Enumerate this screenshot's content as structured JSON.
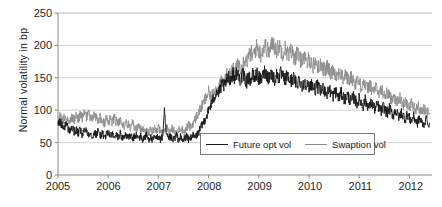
{
  "chart_data": {
    "type": "line",
    "title": "",
    "xlabel": "",
    "ylabel": "Normal volatility in bp",
    "xlim": [
      2005.0,
      2012.45
    ],
    "ylim": [
      0,
      250
    ],
    "grid": true,
    "legend_position": "inside-bottom-center",
    "ytick_labels": [
      "0",
      "50",
      "100",
      "150",
      "200",
      "250"
    ],
    "ytick_values": [
      0,
      50,
      100,
      150,
      200,
      250
    ],
    "xtick_labels": [
      "2005",
      "2006",
      "2007",
      "2008",
      "2009",
      "2010",
      "2011",
      "2012"
    ],
    "xtick_values": [
      2005,
      2006,
      2007,
      2008,
      2009,
      2010,
      2011,
      2012
    ],
    "series": [
      {
        "name": "Future opt vol",
        "color": "#1a1a1a",
        "x": [
          2005.0,
          2005.04,
          2005.08,
          2005.12,
          2005.16,
          2005.2,
          2005.24,
          2005.28,
          2005.32,
          2005.36,
          2005.4,
          2005.44,
          2005.48,
          2005.52,
          2005.56,
          2005.6,
          2005.64,
          2005.68,
          2005.72,
          2005.76,
          2005.8,
          2005.84,
          2005.88,
          2005.92,
          2005.96,
          2006.0,
          2006.04,
          2006.08,
          2006.12,
          2006.16,
          2006.2,
          2006.24,
          2006.28,
          2006.32,
          2006.36,
          2006.4,
          2006.44,
          2006.48,
          2006.52,
          2006.56,
          2006.6,
          2006.64,
          2006.68,
          2006.72,
          2006.76,
          2006.8,
          2006.84,
          2006.88,
          2006.92,
          2006.96,
          2007.0,
          2007.04,
          2007.08,
          2007.12,
          2007.16,
          2007.2,
          2007.24,
          2007.28,
          2007.32,
          2007.36,
          2007.4,
          2007.44,
          2007.48,
          2007.52,
          2007.56,
          2007.6,
          2007.64,
          2007.68,
          2007.72,
          2007.76,
          2007.8,
          2007.84,
          2007.88,
          2007.92,
          2007.96,
          2008.0,
          2008.04,
          2008.08,
          2008.12,
          2008.16,
          2008.2,
          2008.24,
          2008.28,
          2008.32,
          2008.36,
          2008.4,
          2008.44,
          2008.48,
          2008.52,
          2008.56,
          2008.6,
          2008.64,
          2008.68,
          2008.72,
          2008.76,
          2008.8,
          2008.84,
          2008.88,
          2008.92,
          2008.96,
          2009.0,
          2009.04,
          2009.08,
          2009.12,
          2009.16,
          2009.2,
          2009.24,
          2009.28,
          2009.32,
          2009.36,
          2009.4,
          2009.44,
          2009.48,
          2009.52,
          2009.56,
          2009.6,
          2009.64,
          2009.68,
          2009.72,
          2009.76,
          2009.8,
          2009.84,
          2009.88,
          2009.92,
          2009.96,
          2010.0,
          2010.04,
          2010.08,
          2010.12,
          2010.16,
          2010.2,
          2010.24,
          2010.28,
          2010.32,
          2010.36,
          2010.4,
          2010.44,
          2010.48,
          2010.52,
          2010.56,
          2010.6,
          2010.64,
          2010.68,
          2010.72,
          2010.76,
          2010.8,
          2010.84,
          2010.88,
          2010.92,
          2010.96,
          2011.0,
          2011.04,
          2011.08,
          2011.12,
          2011.16,
          2011.2,
          2011.24,
          2011.28,
          2011.32,
          2011.36,
          2011.4,
          2011.44,
          2011.48,
          2011.52,
          2011.56,
          2011.6,
          2011.64,
          2011.68,
          2011.72,
          2011.76,
          2011.8,
          2011.84,
          2011.88,
          2011.92,
          2011.96,
          2012.0,
          2012.04,
          2012.08,
          2012.12,
          2012.16,
          2012.2,
          2012.24,
          2012.28,
          2012.32,
          2012.4
        ],
        "y": [
          78,
          82,
          76,
          73,
          80,
          71,
          68,
          74,
          66,
          70,
          64,
          69,
          62,
          67,
          71,
          63,
          66,
          60,
          65,
          62,
          68,
          61,
          64,
          58,
          62,
          66,
          60,
          63,
          57,
          61,
          59,
          64,
          56,
          60,
          63,
          57,
          61,
          55,
          59,
          62,
          56,
          60,
          54,
          58,
          61,
          55,
          59,
          53,
          58,
          56,
          61,
          54,
          58,
          96,
          60,
          55,
          59,
          53,
          57,
          61,
          55,
          58,
          52,
          56,
          60,
          54,
          58,
          62,
          57,
          61,
          66,
          72,
          78,
          85,
          92,
          99,
          107,
          114,
          122,
          130,
          126,
          134,
          141,
          136,
          145,
          152,
          147,
          156,
          150,
          158,
          152,
          147,
          155,
          149,
          144,
          152,
          146,
          154,
          148,
          156,
          150,
          146,
          153,
          160,
          155,
          150,
          158,
          152,
          147,
          155,
          150,
          157,
          151,
          146,
          153,
          148,
          144,
          150,
          145,
          140,
          148,
          142,
          137,
          145,
          139,
          134,
          142,
          136,
          131,
          138,
          133,
          128,
          135,
          130,
          125,
          132,
          127,
          122,
          130,
          124,
          119,
          127,
          121,
          116,
          124,
          118,
          113,
          121,
          115,
          110,
          118,
          112,
          107,
          115,
          109,
          104,
          112,
          106,
          101,
          109,
          103,
          98,
          106,
          100,
          95,
          103,
          97,
          92,
          100,
          94,
          89,
          97,
          91,
          86,
          94,
          88,
          83,
          91,
          85,
          80,
          88,
          82,
          77,
          85,
          80
        ]
      },
      {
        "name": "Swaption vol",
        "color": "#8c8c8c",
        "x": [
          2005.0,
          2005.04,
          2005.08,
          2005.12,
          2005.16,
          2005.2,
          2005.24,
          2005.28,
          2005.32,
          2005.36,
          2005.4,
          2005.44,
          2005.48,
          2005.52,
          2005.56,
          2005.6,
          2005.64,
          2005.68,
          2005.72,
          2005.76,
          2005.8,
          2005.84,
          2005.88,
          2005.92,
          2005.96,
          2006.0,
          2006.04,
          2006.08,
          2006.12,
          2006.16,
          2006.2,
          2006.24,
          2006.28,
          2006.32,
          2006.36,
          2006.4,
          2006.44,
          2006.48,
          2006.52,
          2006.56,
          2006.6,
          2006.64,
          2006.68,
          2006.72,
          2006.76,
          2006.8,
          2006.84,
          2006.88,
          2006.92,
          2006.96,
          2007.0,
          2007.04,
          2007.08,
          2007.12,
          2007.16,
          2007.2,
          2007.24,
          2007.28,
          2007.32,
          2007.36,
          2007.4,
          2007.44,
          2007.48,
          2007.52,
          2007.56,
          2007.6,
          2007.64,
          2007.68,
          2007.72,
          2007.76,
          2007.8,
          2007.84,
          2007.88,
          2007.92,
          2007.96,
          2008.0,
          2008.04,
          2008.08,
          2008.12,
          2008.16,
          2008.2,
          2008.24,
          2008.28,
          2008.32,
          2008.36,
          2008.4,
          2008.44,
          2008.48,
          2008.52,
          2008.56,
          2008.6,
          2008.64,
          2008.68,
          2008.72,
          2008.76,
          2008.8,
          2008.84,
          2008.88,
          2008.92,
          2008.96,
          2009.0,
          2009.04,
          2009.08,
          2009.12,
          2009.16,
          2009.2,
          2009.24,
          2009.28,
          2009.32,
          2009.36,
          2009.4,
          2009.44,
          2009.48,
          2009.52,
          2009.56,
          2009.6,
          2009.64,
          2009.68,
          2009.72,
          2009.76,
          2009.8,
          2009.84,
          2009.88,
          2009.92,
          2009.96,
          2010.0,
          2010.04,
          2010.08,
          2010.12,
          2010.16,
          2010.2,
          2010.24,
          2010.28,
          2010.32,
          2010.36,
          2010.4,
          2010.44,
          2010.48,
          2010.52,
          2010.56,
          2010.6,
          2010.64,
          2010.68,
          2010.72,
          2010.76,
          2010.8,
          2010.84,
          2010.88,
          2010.92,
          2010.96,
          2011.0,
          2011.04,
          2011.08,
          2011.12,
          2011.16,
          2011.2,
          2011.24,
          2011.28,
          2011.32,
          2011.36,
          2011.4,
          2011.44,
          2011.48,
          2011.52,
          2011.56,
          2011.6,
          2011.64,
          2011.68,
          2011.72,
          2011.76,
          2011.8,
          2011.84,
          2011.88,
          2011.92,
          2011.96,
          2012.0,
          2012.04,
          2012.08,
          2012.12,
          2012.16,
          2012.2,
          2012.24,
          2012.28,
          2012.32,
          2012.4
        ],
        "y": [
          86,
          90,
          84,
          88,
          82,
          87,
          83,
          89,
          85,
          91,
          86,
          92,
          88,
          94,
          89,
          95,
          90,
          86,
          92,
          87,
          83,
          89,
          84,
          80,
          86,
          81,
          86,
          82,
          88,
          83,
          79,
          85,
          80,
          76,
          82,
          77,
          73,
          79,
          74,
          70,
          76,
          71,
          67,
          73,
          68,
          64,
          70,
          66,
          71,
          67,
          72,
          68,
          64,
          70,
          75,
          70,
          66,
          72,
          67,
          63,
          69,
          74,
          70,
          66,
          72,
          77,
          73,
          79,
          84,
          90,
          96,
          102,
          108,
          115,
          121,
          128,
          118,
          126,
          133,
          129,
          137,
          144,
          139,
          147,
          154,
          149,
          157,
          164,
          158,
          166,
          172,
          165,
          173,
          180,
          174,
          182,
          189,
          183,
          191,
          198,
          192,
          186,
          194,
          200,
          195,
          189,
          197,
          204,
          198,
          192,
          200,
          194,
          188,
          196,
          190,
          184,
          192,
          186,
          180,
          188,
          182,
          176,
          184,
          178,
          172,
          180,
          174,
          168,
          176,
          170,
          164,
          172,
          166,
          160,
          168,
          162,
          156,
          164,
          158,
          152,
          160,
          154,
          148,
          156,
          150,
          144,
          152,
          146,
          140,
          148,
          142,
          136,
          144,
          138,
          132,
          140,
          134,
          128,
          136,
          130,
          124,
          132,
          126,
          120,
          128,
          122,
          116,
          124,
          118,
          112,
          120,
          114,
          108,
          116,
          110,
          104,
          112,
          106,
          100,
          108,
          102,
          96,
          104,
          98,
          95
        ]
      }
    ]
  },
  "axis": {
    "y_label": "Normal volatility in bp",
    "y_ticks": [
      "0",
      "50",
      "100",
      "150",
      "200",
      "250"
    ],
    "x_ticks": [
      "2005",
      "2006",
      "2007",
      "2008",
      "2009",
      "2010",
      "2011",
      "2012"
    ]
  },
  "legend": {
    "entries": [
      {
        "label": "Future opt vol",
        "color": "#1a1a1a"
      },
      {
        "label": "Swaption vol",
        "color": "#8c8c8c"
      }
    ]
  },
  "colors": {
    "series_black": "#1a1a1a",
    "series_gray": "#8c8c8c",
    "grid": "#c8c8c8",
    "axis": "#8a8a8a",
    "background": "#ffffff"
  }
}
